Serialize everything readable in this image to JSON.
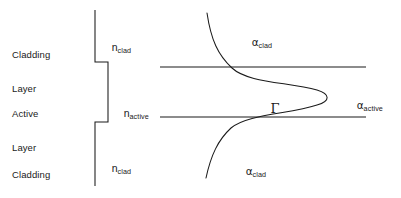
{
  "figure": {
    "stroke_color": "#1a1a1a",
    "background_color": "#ffffff"
  },
  "region_labels": [
    {
      "name": "upper-cladding",
      "line1": "Cladding",
      "line2": "Layer",
      "x": 12,
      "y": 27
    },
    {
      "name": "active",
      "line1": "Active",
      "line2": "Layer",
      "x": 12,
      "y": 86
    },
    {
      "name": "lower-cladding",
      "line1": "Cladding",
      "line2": "Layer",
      "x": 12,
      "y": 147
    }
  ],
  "index_labels": [
    {
      "name": "n-clad-upper",
      "base": "n",
      "sub": "clad",
      "x": 100,
      "y": 29
    },
    {
      "name": "n-active",
      "base": "n",
      "sub": "active",
      "x": 112,
      "y": 95
    },
    {
      "name": "n-clad-lower",
      "base": "n",
      "sub": "clad",
      "x": 100,
      "y": 150
    }
  ],
  "loss_labels": [
    {
      "name": "alpha-clad-upper",
      "base": "α",
      "sub": "clad",
      "x": 240,
      "y": 24
    },
    {
      "name": "alpha-active",
      "base": "α",
      "sub": "active",
      "x": 345,
      "y": 87
    },
    {
      "name": "alpha-clad-lower",
      "base": "α",
      "sub": "clad",
      "x": 234,
      "y": 153
    }
  ],
  "confinement_label": {
    "name": "gamma-confinement-factor",
    "text": "Γ",
    "x": 254,
    "y": 86
  },
  "index_step_profile": {
    "name": "refractive-index-step",
    "description": "Step refractive index profile: low in cladding, higher in active layer",
    "points": "95,10 95,62 108,62 108,122 95,122 95,186"
  },
  "boundaries": [
    {
      "name": "upper-heterojunction-line",
      "x1": 160,
      "y1": 67,
      "x2": 366,
      "y2": 67
    },
    {
      "name": "lower-heterojunction-line",
      "x1": 160,
      "y1": 117,
      "x2": 366,
      "y2": 117
    }
  ],
  "mode_profile": {
    "name": "optical-mode-intensity-curve",
    "description": "Transverse optical mode intensity: exponential decay in cladding, peak in active layer",
    "path": "M 207 13 C 211 40, 218 55, 232 68 C 248 83, 288 82, 317 90 C 330 94, 331 101, 317 105 C 290 114, 247 114, 231 128 C 218 140, 211 155, 206 178"
  }
}
